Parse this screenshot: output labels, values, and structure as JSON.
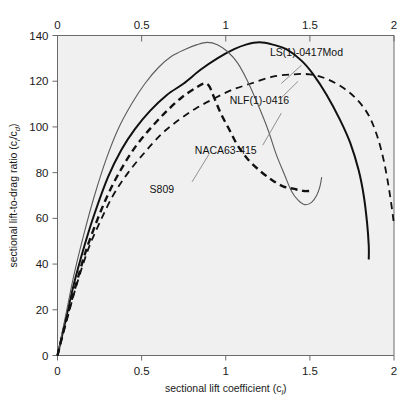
{
  "chart_data": {
    "type": "line",
    "title": "",
    "xlabel": "sectional lift coefficient (c_l)",
    "ylabel": "sectional lift-to-drag ratio (c_l/c_d)",
    "xlim": [
      0,
      2
    ],
    "ylim": [
      0,
      140
    ],
    "xticks": [
      0,
      0.5,
      1,
      1.5,
      2
    ],
    "yticks": [
      0,
      20,
      40,
      60,
      80,
      100,
      120,
      140
    ],
    "xtick_labels": [
      "0",
      "0.5",
      "1",
      "1.5",
      "2"
    ],
    "ytick_labels": [
      "0",
      "20",
      "40",
      "60",
      "80",
      "100",
      "120",
      "140"
    ],
    "top_axis": true,
    "top_xticks": [
      0,
      0.5,
      1,
      1.5,
      2
    ],
    "top_xtick_labels": [
      "0",
      "0.5",
      "1",
      "1.5",
      "2"
    ],
    "grid": false,
    "legend_position": "inline-annotations",
    "background_color": "#f0f0f0",
    "series": [
      {
        "name": "LS(1)-0417Mod",
        "style": "solid",
        "color": "#111111",
        "width": 2.0,
        "label_x": 1.48,
        "label_y": 131,
        "leader": [
          [
            1.45,
            127
          ],
          [
            1.33,
            119
          ]
        ],
        "points": [
          [
            0.0,
            0
          ],
          [
            0.05,
            16
          ],
          [
            0.1,
            32
          ],
          [
            0.16,
            48
          ],
          [
            0.22,
            62
          ],
          [
            0.3,
            78
          ],
          [
            0.38,
            90
          ],
          [
            0.46,
            99
          ],
          [
            0.55,
            107
          ],
          [
            0.65,
            114
          ],
          [
            0.75,
            119
          ],
          [
            0.85,
            125
          ],
          [
            0.95,
            130
          ],
          [
            1.05,
            134
          ],
          [
            1.12,
            136
          ],
          [
            1.2,
            137
          ],
          [
            1.28,
            136
          ],
          [
            1.36,
            134
          ],
          [
            1.45,
            129
          ],
          [
            1.52,
            123
          ],
          [
            1.6,
            114
          ],
          [
            1.68,
            103
          ],
          [
            1.74,
            93
          ],
          [
            1.79,
            81
          ],
          [
            1.82,
            70
          ],
          [
            1.84,
            58
          ],
          [
            1.85,
            48
          ],
          [
            1.85,
            42
          ]
        ]
      },
      {
        "name": "NLF(1)-0416",
        "style": "dashed",
        "color": "#111111",
        "width": 1.8,
        "label_x": 1.2,
        "label_y": 110,
        "leader": [
          [
            1.32,
            112
          ],
          [
            1.43,
            120
          ]
        ],
        "points": [
          [
            0.0,
            0
          ],
          [
            0.05,
            14
          ],
          [
            0.11,
            30
          ],
          [
            0.18,
            46
          ],
          [
            0.25,
            58
          ],
          [
            0.33,
            70
          ],
          [
            0.42,
            80
          ],
          [
            0.52,
            89
          ],
          [
            0.62,
            97
          ],
          [
            0.72,
            103
          ],
          [
            0.82,
            108
          ],
          [
            0.92,
            112
          ],
          [
            1.03,
            116
          ],
          [
            1.15,
            119
          ],
          [
            1.28,
            122
          ],
          [
            1.4,
            123
          ],
          [
            1.5,
            123
          ],
          [
            1.6,
            121
          ],
          [
            1.7,
            117
          ],
          [
            1.78,
            112
          ],
          [
            1.85,
            105
          ],
          [
            1.9,
            96
          ],
          [
            1.94,
            85
          ],
          [
            1.97,
            73
          ],
          [
            1.99,
            63
          ],
          [
            2.0,
            57
          ]
        ]
      },
      {
        "name": "NACA63-415",
        "style": "solid",
        "color": "#5a5a5a",
        "width": 1.1,
        "label_x": 1.0,
        "label_y": 88,
        "leader": [
          [
            1.22,
            92
          ],
          [
            1.33,
            106
          ]
        ],
        "points": [
          [
            0.0,
            0
          ],
          [
            0.05,
            18
          ],
          [
            0.1,
            36
          ],
          [
            0.16,
            54
          ],
          [
            0.22,
            70
          ],
          [
            0.29,
            86
          ],
          [
            0.36,
            99
          ],
          [
            0.44,
            110
          ],
          [
            0.52,
            119
          ],
          [
            0.6,
            126
          ],
          [
            0.68,
            131
          ],
          [
            0.76,
            134
          ],
          [
            0.83,
            136
          ],
          [
            0.89,
            137
          ],
          [
            0.95,
            136
          ],
          [
            1.01,
            133
          ],
          [
            1.07,
            128
          ],
          [
            1.13,
            120
          ],
          [
            1.19,
            110
          ],
          [
            1.25,
            99
          ],
          [
            1.3,
            88
          ],
          [
            1.35,
            79
          ],
          [
            1.39,
            72
          ],
          [
            1.43,
            68
          ],
          [
            1.47,
            66
          ],
          [
            1.51,
            67
          ],
          [
            1.54,
            70
          ],
          [
            1.56,
            74
          ],
          [
            1.57,
            78
          ]
        ]
      },
      {
        "name": "S809",
        "style": "dashed-thick",
        "color": "#111111",
        "width": 2.4,
        "label_x": 0.62,
        "label_y": 71,
        "leader": [
          [
            0.8,
            76
          ],
          [
            0.9,
            88
          ]
        ],
        "points": [
          [
            0.0,
            0
          ],
          [
            0.05,
            15
          ],
          [
            0.11,
            31
          ],
          [
            0.17,
            46
          ],
          [
            0.24,
            60
          ],
          [
            0.31,
            72
          ],
          [
            0.39,
            83
          ],
          [
            0.47,
            92
          ],
          [
            0.56,
            100
          ],
          [
            0.65,
            107
          ],
          [
            0.74,
            113
          ],
          [
            0.82,
            117
          ],
          [
            0.87,
            119
          ],
          [
            0.9,
            118
          ],
          [
            0.93,
            113
          ],
          [
            0.97,
            106
          ],
          [
            1.02,
            99
          ],
          [
            1.07,
            92
          ],
          [
            1.13,
            86
          ],
          [
            1.2,
            81
          ],
          [
            1.27,
            77
          ],
          [
            1.34,
            74
          ],
          [
            1.4,
            73
          ],
          [
            1.46,
            72
          ],
          [
            1.5,
            72
          ]
        ]
      }
    ]
  }
}
